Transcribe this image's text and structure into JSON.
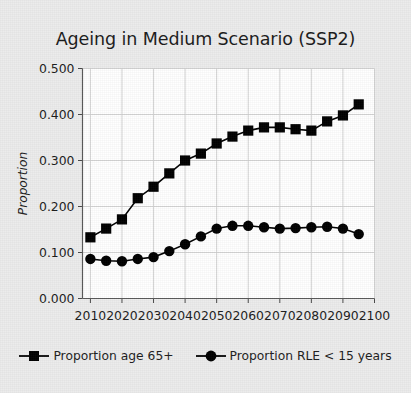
{
  "chart_data": {
    "type": "line",
    "title": "Ageing in Medium Scenario (SSP2)",
    "xlabel": "",
    "ylabel": "Proportion",
    "xlim": [
      2007.5,
      2100
    ],
    "ylim": [
      0.0,
      0.5
    ],
    "grid": true,
    "legend_position": "bottom",
    "x_ticks": [
      "2010",
      "2020",
      "2030",
      "2040",
      "2050",
      "2060",
      "2070",
      "2080",
      "2090",
      "2100"
    ],
    "y_ticks": [
      "0.000",
      "0.100",
      "0.200",
      "0.300",
      "0.400",
      "0.500"
    ],
    "x": [
      2010,
      2015,
      2020,
      2025,
      2030,
      2035,
      2040,
      2045,
      2050,
      2055,
      2060,
      2065,
      2070,
      2075,
      2080,
      2085,
      2090,
      2095
    ],
    "series": [
      {
        "name": "Proportion age 65+",
        "marker": "square",
        "color": "#000000",
        "values": [
          0.133,
          0.152,
          0.172,
          0.218,
          0.243,
          0.272,
          0.3,
          0.315,
          0.337,
          0.352,
          0.365,
          0.372,
          0.372,
          0.368,
          0.365,
          0.385,
          0.398,
          0.422
        ]
      },
      {
        "name": "Proportion RLE < 15 years",
        "marker": "circle",
        "color": "#000000",
        "values": [
          0.086,
          0.082,
          0.081,
          0.086,
          0.09,
          0.103,
          0.118,
          0.135,
          0.152,
          0.158,
          0.158,
          0.155,
          0.152,
          0.153,
          0.155,
          0.156,
          0.152,
          0.14
        ]
      }
    ]
  },
  "legend": {
    "items": [
      {
        "label": "Proportion age 65+",
        "marker": "square"
      },
      {
        "label": "Proportion RLE < 15 years",
        "marker": "circle"
      }
    ]
  }
}
